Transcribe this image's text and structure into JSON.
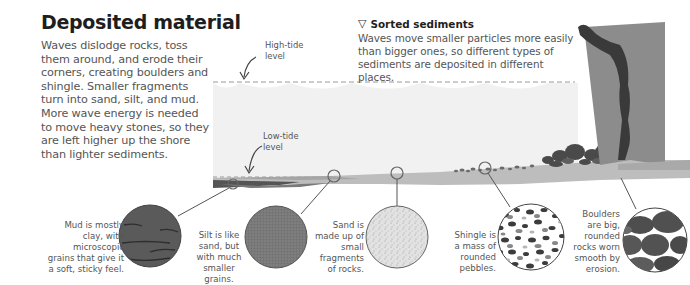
{
  "title": "Deposited material",
  "intro": "Waves dislodge rocks, toss them around, and erode their corners, creating boulders and shingle. Smaller fragments turn into sand, silt, and mud. More wave energy is needed to move heavy stones, so they are left higher up the shore than lighter sediments.",
  "sorted_sediments": {
    "icon": "triangle-down-icon",
    "heading": "Sorted sediments",
    "body": "Waves move smaller particles more easily than bigger ones, so different types of sediments are deposited in different places."
  },
  "tide_labels": {
    "high": {
      "line1": "High-tide",
      "line2": "level"
    },
    "low": {
      "line1": "Low-tide",
      "line2": "level"
    }
  },
  "sediments": [
    {
      "name": "Mud",
      "caption": [
        "Mud is mostly",
        "clay, with",
        "microscopic",
        "grains that give it",
        "a soft, sticky feel."
      ]
    },
    {
      "name": "Silt",
      "caption": [
        "Silt is like",
        "sand, but",
        "with much",
        "smaller grains."
      ]
    },
    {
      "name": "Sand",
      "caption": [
        "Sand is",
        "made up of",
        "small",
        "fragments",
        "of rocks."
      ]
    },
    {
      "name": "Shingle",
      "caption": [
        "Shingle is",
        "a mass of",
        "rounded",
        "pebbles."
      ]
    },
    {
      "name": "Boulders",
      "caption": [
        "Boulders",
        "are big,",
        "rounded",
        "rocks worn",
        "smooth by",
        "erosion."
      ]
    }
  ],
  "colors": {
    "sea": "#f0f0f0",
    "shore": "#b8b8b8",
    "cliff": "#8a8a8a",
    "cliff_dark": "#3c3c3c",
    "mud": "#5a5a5a",
    "silt": "#7a7a7a",
    "sand": "#e0e0e0",
    "rock": "#5c5c5c"
  }
}
